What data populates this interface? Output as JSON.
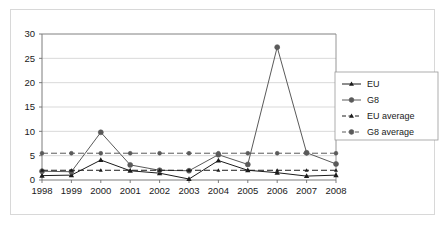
{
  "chart_data": {
    "type": "line",
    "title": "",
    "subtitle": "",
    "xlabel": "",
    "ylabel": "",
    "categories": [
      "1998",
      "1999",
      "2000",
      "2001",
      "2002",
      "2003",
      "2004",
      "2005",
      "2006",
      "2007",
      "2008"
    ],
    "xlim": [
      "1998",
      "2008"
    ],
    "ylim": [
      0,
      30
    ],
    "yticks": [
      0,
      5,
      10,
      15,
      20,
      25,
      30
    ],
    "ytick_labels": [
      "0",
      "5",
      "10",
      "15",
      "20",
      "25",
      "30"
    ],
    "grid": "horizontal",
    "legend_position": "right-inside",
    "series": [
      {
        "name": "EU",
        "style": "solid",
        "marker": "triangle",
        "color": "#1c1c1c",
        "values": [
          0.9,
          1.0,
          4.1,
          1.9,
          1.4,
          0.2,
          4.0,
          2.0,
          1.5,
          0.8,
          1.0
        ]
      },
      {
        "name": "G8",
        "style": "solid",
        "marker": "circle",
        "color": "#5a5a5a",
        "values": [
          1.8,
          1.7,
          9.8,
          3.1,
          2.0,
          1.9,
          5.2,
          3.2,
          27.3,
          5.6,
          3.3
        ]
      },
      {
        "name": "EU average",
        "style": "dashed",
        "marker": "triangle",
        "color": "#1c1c1c",
        "values": [
          2.0,
          2.0,
          2.0,
          2.0,
          2.0,
          2.0,
          2.0,
          2.0,
          2.0,
          2.0,
          2.0
        ]
      },
      {
        "name": "G8 average",
        "style": "dashed",
        "marker": "circle",
        "color": "#5a5a5a",
        "values": [
          5.5,
          5.5,
          5.5,
          5.5,
          5.5,
          5.5,
          5.5,
          5.5,
          5.5,
          5.5,
          5.5
        ]
      }
    ]
  },
  "legend": {
    "items": [
      {
        "label": "EU"
      },
      {
        "label": "G8"
      },
      {
        "label": "EU average"
      },
      {
        "label": "G8 average"
      }
    ]
  },
  "colors": {
    "background": "#ffffff",
    "frame": "#d8d8d8",
    "gridline": "#c9c9c9",
    "axis": "#6e6e6e",
    "series_dark": "#1c1c1c",
    "series_gray": "#5a5a5a",
    "text": "#1a1a1a"
  }
}
